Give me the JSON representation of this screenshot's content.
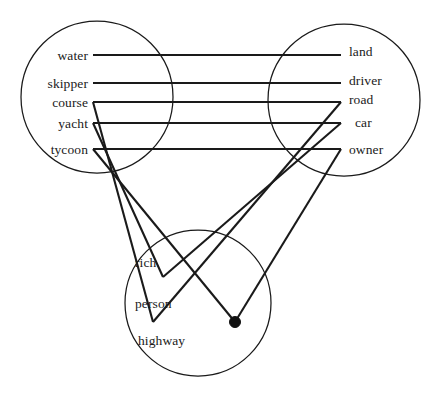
{
  "figure": {
    "type": "semantic-mapping-diagram",
    "title": "",
    "background_color": "#ffffff",
    "line_color": "#1a1a1a",
    "text_color": "#1a1a1a",
    "width": 442,
    "height": 400
  },
  "circles": [
    {
      "id": "left-domain",
      "name": "left-circle",
      "cx": 97,
      "cy": 97,
      "r": 76
    },
    {
      "id": "right-domain",
      "name": "right-circle",
      "cx": 344,
      "cy": 100,
      "r": 76
    },
    {
      "id": "bottom-domain",
      "name": "bottom-circle",
      "cx": 198,
      "cy": 303,
      "r": 73
    }
  ],
  "nodes": {
    "left": [
      {
        "id": "water",
        "label": "water",
        "x": 88,
        "y": 55
      },
      {
        "id": "skipper",
        "label": "skipper",
        "x": 88,
        "y": 83
      },
      {
        "id": "course",
        "label": "course",
        "x": 88,
        "y": 102
      },
      {
        "id": "yacht",
        "label": "yacht",
        "x": 88,
        "y": 123
      },
      {
        "id": "tycoon",
        "label": "tycoon",
        "x": 88,
        "y": 149
      }
    ],
    "right": [
      {
        "id": "land",
        "label": "land",
        "x": 349,
        "y": 51
      },
      {
        "id": "driver",
        "label": "driver",
        "x": 349,
        "y": 80
      },
      {
        "id": "road",
        "label": "road",
        "x": 349,
        "y": 99
      },
      {
        "id": "car",
        "label": "car",
        "x": 355,
        "y": 122
      },
      {
        "id": "owner",
        "label": "owner",
        "x": 349,
        "y": 149
      }
    ],
    "bottom": [
      {
        "id": "rich-person",
        "label_line1": "rich",
        "label_line2": "person",
        "x": 135,
        "y": 283
      },
      {
        "id": "highway",
        "label": "highway",
        "x": 138,
        "y": 340
      }
    ]
  },
  "edges": [
    {
      "id": "water-land",
      "from": "water",
      "to": "land",
      "x1": 93,
      "y1": 55,
      "x2": 341,
      "y2": 55
    },
    {
      "id": "skipper-driver",
      "from": "skipper",
      "to": "driver",
      "x1": 93,
      "y1": 83,
      "x2": 341,
      "y2": 83
    },
    {
      "id": "course-road",
      "from": "course",
      "to": "road",
      "x1": 93,
      "y1": 102,
      "x2": 341,
      "y2": 102
    },
    {
      "id": "yacht-car",
      "from": "yacht",
      "to": "car",
      "x1": 93,
      "y1": 123,
      "x2": 341,
      "y2": 123
    },
    {
      "id": "tycoon-owner",
      "from": "tycoon",
      "to": "owner",
      "x1": 93,
      "y1": 149,
      "x2": 341,
      "y2": 149
    },
    {
      "id": "course-highway",
      "from": "course",
      "to": "highway-vertex",
      "x1": 93,
      "y1": 102,
      "x2": 153,
      "y2": 322
    },
    {
      "id": "yacht-richnode",
      "from": "yacht",
      "to": "rich-vertex",
      "x1": 93,
      "y1": 123,
      "x2": 163,
      "y2": 277
    },
    {
      "id": "tycoon-dot",
      "from": "tycoon",
      "to": "center-dot",
      "x1": 93,
      "y1": 149,
      "x2": 235,
      "y2": 322
    },
    {
      "id": "road-highway",
      "from": "road",
      "to": "highway-vertex",
      "x1": 341,
      "y1": 102,
      "x2": 153,
      "y2": 322
    },
    {
      "id": "car-richnode",
      "from": "car",
      "to": "rich-vertex",
      "x1": 341,
      "y1": 123,
      "x2": 163,
      "y2": 277
    },
    {
      "id": "owner-dot",
      "from": "owner",
      "to": "center-dot",
      "x1": 341,
      "y1": 149,
      "x2": 235,
      "y2": 322
    }
  ],
  "vertices": [
    {
      "id": "center-dot",
      "x": 235,
      "y": 322,
      "r": 5.5,
      "filled": true
    },
    {
      "id": "rich-vertex",
      "x": 163,
      "y": 277,
      "r": 0,
      "filled": false
    },
    {
      "id": "highway-vertex",
      "x": 153,
      "y": 322,
      "r": 0,
      "filled": false
    }
  ]
}
